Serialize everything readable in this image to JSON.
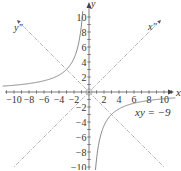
{
  "chart_data": {
    "type": "line",
    "title": "",
    "equation_label": "xy = −9",
    "xlabel": "x",
    "ylabel": "y",
    "rotated_axes": {
      "x_label": "x''",
      "y_label": "y''",
      "angle_deg": 45
    },
    "xlim": [
      -11,
      11
    ],
    "ylim": [
      -10,
      10
    ],
    "x_ticks": [
      -10,
      -8,
      -6,
      -4,
      -2,
      2,
      4,
      6,
      8,
      10
    ],
    "y_ticks": [
      -10,
      -8,
      -6,
      -4,
      -2,
      2,
      4,
      6,
      8,
      10
    ],
    "x_tick_labels": [
      "−10",
      "−8",
      "−6",
      "−4",
      "−2",
      "2",
      "4",
      "6",
      "8",
      "10"
    ],
    "y_tick_labels": [
      "−10",
      "−8",
      "−6",
      "−4",
      "−2",
      "2",
      "4",
      "6",
      "8",
      "10"
    ],
    "series": [
      {
        "name": "xy = -9",
        "equation": "y = -9/x",
        "branches": [
          "x<0",
          "x>0"
        ]
      }
    ],
    "grid": false,
    "legend": "none"
  },
  "labels": {
    "x_axis": "x",
    "y_axis": "y",
    "x_rot": "x″",
    "y_rot": "y″",
    "equation": "xy = −9"
  },
  "colors": {
    "axis": "#444444",
    "curve": "#777777",
    "rotated_axis": "#999999"
  }
}
